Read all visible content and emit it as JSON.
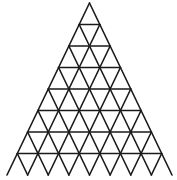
{
  "diagram": {
    "type": "triangular-grid",
    "rows": 8,
    "apex": [
      89.5,
      3
    ],
    "base_left": [
      7,
      175
    ],
    "base_right": [
      172,
      175
    ],
    "bottom_edge_drawn": false,
    "stroke_color": "#1a1a1a",
    "background_color": "#ffffff"
  }
}
